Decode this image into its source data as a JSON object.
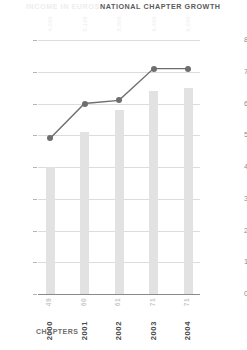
{
  "header": {
    "inactive_tab": "INCOME IN EUROS",
    "active_tab": "NATIONAL CHAPTER GROWTH"
  },
  "axis_caption": "CHAPTERS",
  "colors": {
    "line": "#6e6e6e",
    "bar": "#e2e2e2",
    "grid": "#dcdcdc",
    "baseline": "#8a8a8a",
    "active_text": "#5b5b5b",
    "inactive_text": "#ededed"
  },
  "chart_data": {
    "type": "bar",
    "title": "NATIONAL CHAPTER GROWTH",
    "xlabel": "",
    "ylabel": "CHAPTERS",
    "categories": [
      "2000",
      "2001",
      "2002",
      "2003",
      "2004"
    ],
    "grid": true,
    "legend": "none",
    "left_axis": {
      "label": "CHAPTERS",
      "ticks": [
        0,
        10,
        20,
        30,
        40,
        50,
        60,
        70,
        80
      ],
      "ylim": [
        0,
        80
      ]
    },
    "right_axis": {
      "label": "INCOME IN EUROS",
      "ticks": [
        0,
        1000,
        2000,
        3000,
        4000,
        5000,
        6000,
        7000,
        8000
      ],
      "ylim": [
        0,
        8000
      ]
    },
    "series": [
      {
        "name": "CHAPTERS",
        "type": "line",
        "axis": "left",
        "values": [
          49,
          60,
          61,
          71,
          71
        ]
      },
      {
        "name": "INCOME IN EUROS",
        "type": "bar",
        "axis": "right",
        "values": [
          4000,
          5100,
          5800,
          6400,
          6500
        ]
      }
    ],
    "point_labels": [
      "49",
      "60",
      "61",
      "71",
      "71"
    ],
    "bar_top_labels": [
      "4,000",
      "5,100",
      "5,800",
      "6,400",
      "6,500"
    ]
  }
}
